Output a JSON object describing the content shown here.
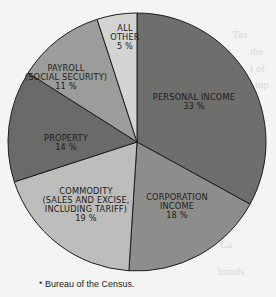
{
  "chart_data": {
    "type": "pie",
    "title": "",
    "start_angle_deg": 0,
    "direction": "clockwise",
    "slices": [
      {
        "label": "PERSONAL INCOME",
        "value": 33,
        "display": "33 %",
        "color": "#6e6e6c"
      },
      {
        "label": "CORPORATION INCOME",
        "value": 18,
        "display": "18 %",
        "color": "#8d8d8b"
      },
      {
        "label": "COMMODITY (SALES AND EXCISE, INCLUDING TARIFF)",
        "value": 19,
        "display": "19 %",
        "color": "#bdbdbb"
      },
      {
        "label": "PROPERTY",
        "value": 14,
        "display": "14 %",
        "color": "#6a6a68"
      },
      {
        "label": "PAYROLL (SOCIAL SECURITY)",
        "value": 11,
        "display": "11 %",
        "color": "#9c9c9a"
      },
      {
        "label": "ALL OTHER",
        "value": 5,
        "display": "5 %",
        "color": "#d4d4d2"
      }
    ],
    "legend": "none",
    "footnote": "* Bureau of the Census."
  },
  "labels": {
    "personal_income": {
      "l1": "PERSONAL INCOME",
      "l2": "33 %"
    },
    "corporation_income": {
      "l1": "CORPORATION",
      "l2": "INCOME",
      "l3": "18 %"
    },
    "commodity": {
      "l1": "COMMODITY",
      "l2": "(SALES AND EXCISE,",
      "l3": "INCLUDING TARIFF)",
      "l4": "19 %"
    },
    "property": {
      "l1": "PROPERTY",
      "l2": "14 %"
    },
    "payroll": {
      "l1": "PAYROLL",
      "l2": "(SOCIAL SECURITY)",
      "l3": "11 %"
    },
    "all_other": {
      "l1": "ALL",
      "l2": "OTHER",
      "l3": "5 %"
    }
  },
  "footnote": "* Bureau of the Census."
}
